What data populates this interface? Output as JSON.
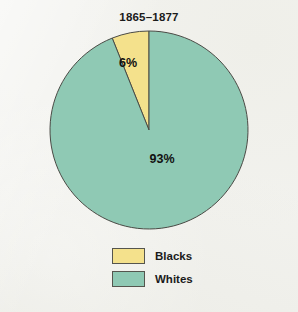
{
  "figure": {
    "width": 298,
    "height": 312,
    "background_color": "#F2F2EE"
  },
  "chart_data": {
    "type": "pie",
    "title": "1865–1877",
    "xlabel": "",
    "ylabel": "",
    "categories": [
      "Blacks",
      "Whites"
    ],
    "values": [
      6,
      93
    ],
    "value_labels": [
      "6%",
      "93%"
    ],
    "unit": "percent",
    "colors": [
      "#F4E18C",
      "#8FC9B4"
    ],
    "outline_color": "#4A4A45",
    "start_angle_deg": 90,
    "direction": "counterclockwise",
    "legend_position": "bottom",
    "grid": false,
    "center": {
      "x": 149,
      "y": 130
    },
    "radius": 99,
    "slices": [
      {
        "name": "Blacks",
        "value": 6,
        "label": "6%",
        "color": "#F4E18C",
        "label_x": 128,
        "label_y": 67
      },
      {
        "name": "Whites",
        "value": 93,
        "label": "93%",
        "color": "#8FC9B4",
        "label_x": 162,
        "label_y": 163
      }
    ]
  },
  "legend": {
    "items": [
      {
        "label": "Blacks",
        "color": "#F4E18C"
      },
      {
        "label": "Whites",
        "color": "#8FC9B4"
      }
    ]
  }
}
